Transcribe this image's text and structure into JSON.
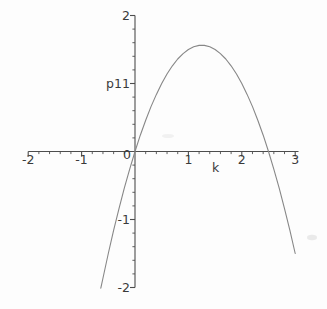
{
  "figure": {
    "background_color": "#fdfdfd",
    "axis_color": "#4d4d4d",
    "curve_color": "#878787",
    "label_color": "#3a3a3a",
    "smudge_color": "#e3e3e3"
  },
  "chart_data": {
    "type": "line",
    "title": "",
    "xlabel": "k",
    "ylabel": "p1",
    "xlim": [
      -2,
      3
    ],
    "ylim": [
      -2,
      2
    ],
    "grid": false,
    "legend": "none",
    "x_major_ticks": [
      -2,
      -1,
      1,
      2,
      3
    ],
    "x_tick_labels": [
      "-2",
      "-1",
      "1",
      "2",
      "3"
    ],
    "y_major_ticks": [
      -2,
      -1,
      1,
      2
    ],
    "y_tick_labels": [
      "-2",
      "-1",
      "1",
      "2"
    ],
    "origin_label": "0",
    "minor_tick_step": 0.2,
    "series": [
      {
        "name": "p1",
        "points": [
          [
            -0.64,
            -2.01
          ],
          [
            -0.6,
            -1.86
          ],
          [
            -0.5,
            -1.5
          ],
          [
            -0.4,
            -1.16
          ],
          [
            -0.3,
            -0.84
          ],
          [
            -0.2,
            -0.54
          ],
          [
            -0.1,
            -0.26
          ],
          [
            0,
            0
          ],
          [
            0.1,
            0.24
          ],
          [
            0.2,
            0.46
          ],
          [
            0.3,
            0.66
          ],
          [
            0.4,
            0.84
          ],
          [
            0.5,
            1.0
          ],
          [
            0.6,
            1.14
          ],
          [
            0.7,
            1.26
          ],
          [
            0.8,
            1.36
          ],
          [
            0.9,
            1.44
          ],
          [
            1.0,
            1.5
          ],
          [
            1.1,
            1.54
          ],
          [
            1.2,
            1.56
          ],
          [
            1.25,
            1.5625
          ],
          [
            1.3,
            1.56
          ],
          [
            1.4,
            1.54
          ],
          [
            1.5,
            1.5
          ],
          [
            1.6,
            1.44
          ],
          [
            1.7,
            1.36
          ],
          [
            1.8,
            1.26
          ],
          [
            1.9,
            1.14
          ],
          [
            2.0,
            1.0
          ],
          [
            2.1,
            0.84
          ],
          [
            2.2,
            0.66
          ],
          [
            2.3,
            0.46
          ],
          [
            2.4,
            0.24
          ],
          [
            2.5,
            0.0
          ],
          [
            2.6,
            -0.26
          ],
          [
            2.7,
            -0.54
          ],
          [
            2.8,
            -0.84
          ],
          [
            2.9,
            -1.16
          ],
          [
            3.0,
            -1.5
          ]
        ]
      }
    ]
  }
}
